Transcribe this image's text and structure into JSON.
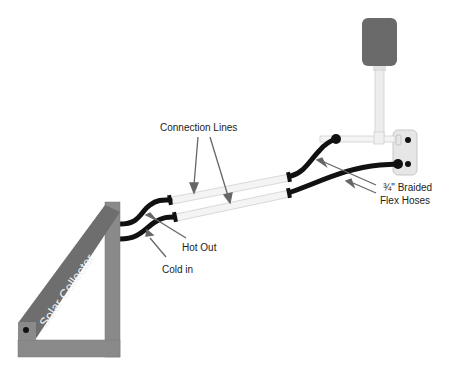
{
  "diagram": {
    "type": "solar water heating plumbing schematic",
    "labels": {
      "connection_lines": "Connection Lines",
      "flex_hoses_line1": "¾\" Braided",
      "flex_hoses_line2": "Flex Hoses",
      "hot_out": "Hot Out",
      "cold_in": "Cold in",
      "solar_collector": "Solar Collector"
    },
    "components": [
      {
        "name": "Solar Collector",
        "shape": "tilted panel on triangular frame"
      },
      {
        "name": "Connection Lines",
        "count": 2,
        "shape": "white insulated pipes"
      },
      {
        "name": "¾\" Braided Flex Hoses",
        "count": 2,
        "shape": "black curved hoses"
      },
      {
        "name": "Tank",
        "shape": "dark gray rounded rectangle on vertical pipe"
      },
      {
        "name": "Wall plate / valve fitting",
        "shape": "light gray plate with two ports"
      }
    ],
    "colors": {
      "frame": "#8a8a8a",
      "panel": "#6e6e6e",
      "hose": "#111111",
      "pipe": "#f4f4f4",
      "tank": "#6a6a6a",
      "arrow": "#666666"
    }
  }
}
